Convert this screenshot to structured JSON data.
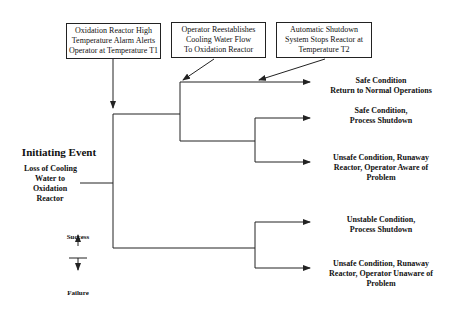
{
  "diagram": {
    "type": "event-tree",
    "events": [
      {
        "id": "e1",
        "lines": [
          "Oxidation Reactor High",
          "Temperature Alarm Alerts",
          "Operator at Temperature T1"
        ]
      },
      {
        "id": "e2",
        "lines": [
          "Operator Reestablishes",
          "Cooling Water Flow",
          "To Oxidation Reactor"
        ]
      },
      {
        "id": "e3",
        "lines": [
          "Automatic Shutdown",
          "System Stops Reactor at",
          "Temperature T2"
        ]
      }
    ],
    "initiating_event": {
      "title": "Initiating Event",
      "lines": [
        "Loss of Cooling",
        "Water to",
        "Oxidation",
        "Reactor"
      ]
    },
    "outcomes": [
      {
        "lines": [
          "Safe Condition",
          "Return to Normal Operations"
        ]
      },
      {
        "lines": [
          "Safe Condition,",
          "Process Shutdown"
        ]
      },
      {
        "lines": [
          "Unsafe Condition, Runaway",
          "Reactor, Operator Aware of",
          "Problem"
        ]
      },
      {
        "lines": [
          "Unstable Condition,",
          "Process Shutdown"
        ]
      },
      {
        "lines": [
          "Unsafe Condition, Runaway",
          "Reactor, Operator Unaware of",
          "Problem"
        ]
      }
    ],
    "legend": {
      "success": "Success",
      "failure": "Failure"
    },
    "colors": {
      "line": "#222222",
      "background": "#ffffff"
    }
  }
}
